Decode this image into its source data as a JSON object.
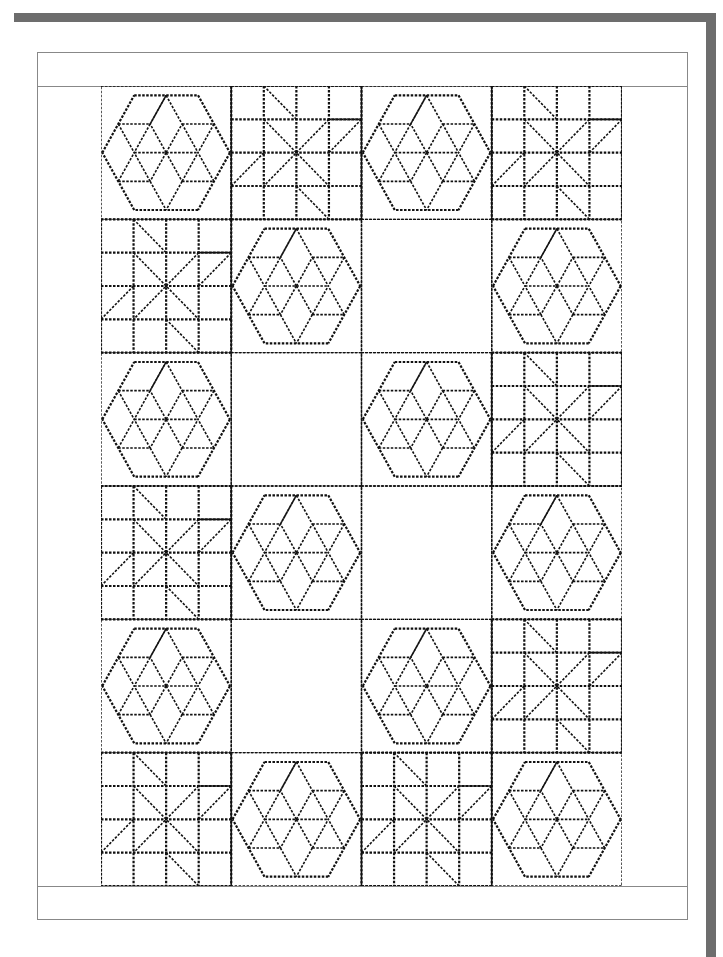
{
  "page": {
    "background": "#ffffff",
    "bar_color": "#6d6d6d",
    "frame_color": "#888888",
    "stitch_color": "#111111"
  },
  "quilt": {
    "title": "",
    "rows": 6,
    "cols": 4,
    "layout": [
      [
        "hexagon-star",
        "eight-point-star",
        "hexagon-star",
        "eight-point-star"
      ],
      [
        "eight-point-star",
        "hexagon-star",
        "blank",
        "hexagon-star"
      ],
      [
        "hexagon-star",
        "blank",
        "hexagon-star",
        "eight-point-star"
      ],
      [
        "eight-point-star",
        "hexagon-star",
        "blank",
        "hexagon-star"
      ],
      [
        "hexagon-star",
        "blank",
        "hexagon-star",
        "eight-point-star"
      ],
      [
        "eight-point-star",
        "hexagon-star",
        "eight-point-star",
        "hexagon-star"
      ]
    ],
    "block_legend": {
      "hexagon-star": "Hexagon with six-point diamond star (dashed stitch lines)",
      "eight-point-star": "4x4 grid with eight-point star diagonals (dashed stitch lines)",
      "blank": "Plain block"
    }
  }
}
